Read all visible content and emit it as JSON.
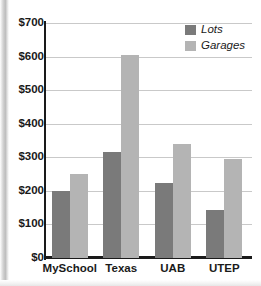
{
  "chart_data": {
    "type": "bar",
    "title": "",
    "xlabel": "",
    "ylabel": "",
    "categories": [
      "MySchool",
      "Texas",
      "UAB",
      "UTEP"
    ],
    "series": [
      {
        "name": "Lots",
        "color": "#7a7a7a",
        "values": [
          200,
          315,
          222,
          143
        ]
      },
      {
        "name": "Garages",
        "color": "#b4b4b4",
        "values": [
          250,
          605,
          340,
          295
        ]
      }
    ],
    "ylim": [
      0,
      700
    ],
    "ytick_values": [
      0,
      100,
      200,
      300,
      400,
      500,
      600,
      700
    ],
    "ytick_labels": [
      "$0",
      "$100",
      "$200",
      "$300",
      "$400",
      "$500",
      "$600",
      "$700"
    ],
    "grid": true,
    "legend_position": "top-right"
  }
}
